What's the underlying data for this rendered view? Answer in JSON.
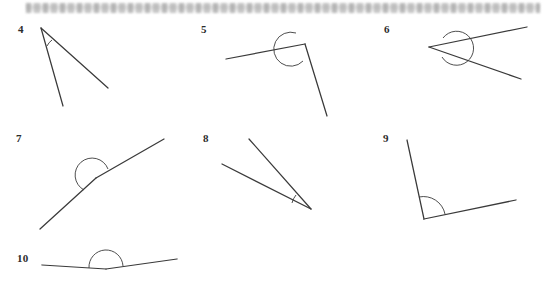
{
  "page": {
    "width": 543,
    "height": 281,
    "background_color": "#ffffff",
    "ink_color": "#3a3a3a",
    "label_color": "#2b2b2b",
    "header_band": {
      "description": "blurred illegible scanned text strip",
      "text": ""
    }
  },
  "figures": [
    {
      "label": "4",
      "label_x": 18,
      "label_y": 24,
      "vertex": [
        41,
        28
      ],
      "rays": [
        {
          "name": "ray-a",
          "end": [
            108,
            88
          ]
        },
        {
          "name": "ray-b",
          "end": [
            63,
            106
          ]
        }
      ],
      "arc": {
        "type": "small-arc",
        "d": "M 52 40 A 16 16 0 0 0 47 46",
        "angle_kind": "acute"
      }
    },
    {
      "label": "5",
      "label_x": 201,
      "label_y": 24,
      "vertex": [
        305,
        44
      ],
      "rays": [
        {
          "name": "ray-a",
          "end": [
            226,
            59
          ]
        },
        {
          "name": "ray-b",
          "end": [
            327,
            116
          ]
        }
      ],
      "arc": {
        "type": "reflex-circle",
        "d": "M 303 61 A 17 17 0 1 1 296 33",
        "angle_kind": "reflex"
      }
    },
    {
      "label": "6",
      "label_x": 384,
      "label_y": 24,
      "vertex": [
        429,
        47
      ],
      "rays": [
        {
          "name": "ray-a",
          "end": [
            527,
            27
          ]
        },
        {
          "name": "ray-b",
          "end": [
            521,
            79
          ]
        }
      ],
      "arc": {
        "type": "reflex-circle",
        "d": "M 442 57 A 17 17 0 1 0 443 38",
        "angle_kind": "reflex"
      }
    },
    {
      "label": "7",
      "label_x": 16,
      "label_y": 133,
      "vertex": [
        96,
        178
      ],
      "rays": [
        {
          "name": "ray-a",
          "end": [
            40,
            229
          ]
        },
        {
          "name": "ray-b",
          "end": [
            164,
            139
          ]
        }
      ],
      "arc": {
        "type": "reflex-circle",
        "d": "M 108 169 A 17 17 0 1 0 84 190",
        "angle_kind": "reflex"
      }
    },
    {
      "label": "8",
      "label_x": 203,
      "label_y": 133,
      "vertex": [
        311,
        209
      ],
      "rays": [
        {
          "name": "ray-a",
          "end": [
            249,
            139
          ]
        },
        {
          "name": "ray-b",
          "end": [
            222,
            164
          ]
        }
      ],
      "arc": {
        "type": "small-arc",
        "d": "M 296 195 A 20 20 0 0 0 292 203",
        "angle_kind": "acute"
      }
    },
    {
      "label": "9",
      "label_x": 383,
      "label_y": 133,
      "vertex": [
        424,
        219
      ],
      "rays": [
        {
          "name": "ray-a",
          "end": [
            407,
            140
          ]
        },
        {
          "name": "ray-b",
          "end": [
            516,
            200
          ]
        }
      ],
      "arc": {
        "type": "wide-arc",
        "d": "M 419 197 A 22 22 0 0 1 445 214",
        "angle_kind": "obtuse"
      }
    },
    {
      "label": "10",
      "label_x": 17,
      "label_y": 253,
      "vertex": [
        106,
        269
      ],
      "rays": [
        {
          "name": "ray-a",
          "end": [
            42,
            265
          ]
        },
        {
          "name": "ray-b",
          "end": [
            177,
            259
          ]
        }
      ],
      "arc": {
        "type": "semicircle",
        "d": "M 89 268 A 17 17 0 0 1 123 266",
        "angle_kind": "straight-ish"
      }
    }
  ]
}
